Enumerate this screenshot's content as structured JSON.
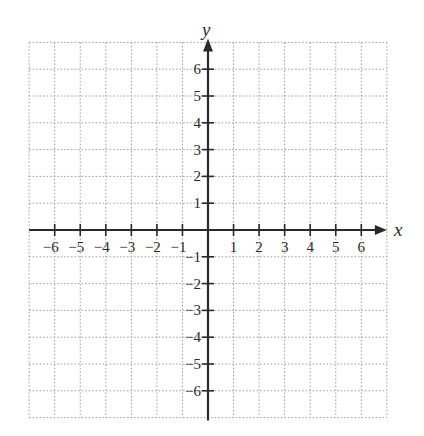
{
  "chart_data": {
    "type": "coordinate-grid",
    "title": "",
    "xlabel": "x",
    "ylabel": "y",
    "xlim": [
      -7,
      7
    ],
    "ylim": [
      -7,
      7
    ],
    "grid": true,
    "grid_style": "dotted",
    "x_ticks": [
      -6,
      -5,
      -4,
      -3,
      -2,
      -1,
      1,
      2,
      3,
      4,
      5,
      6
    ],
    "y_ticks": [
      -6,
      -5,
      -4,
      -3,
      -2,
      -1,
      1,
      2,
      3,
      4,
      5,
      6
    ],
    "x_tick_labels": [
      "−6",
      "−5",
      "−4",
      "−3",
      "−2",
      "−1",
      "1",
      "2",
      "3",
      "4",
      "5",
      "6"
    ],
    "y_tick_labels": [
      "−6",
      "−5",
      "−4",
      "−3",
      "−2",
      "−1",
      "1",
      "2",
      "3",
      "4",
      "5",
      "6"
    ],
    "arrows": {
      "x_positive": true,
      "y_positive": true
    },
    "series": []
  },
  "axes": {
    "x_name": "x",
    "y_name": "y"
  },
  "colors": {
    "axis": "#2a2a2a",
    "grid": "#9a9a9a",
    "background": "#ffffff"
  }
}
